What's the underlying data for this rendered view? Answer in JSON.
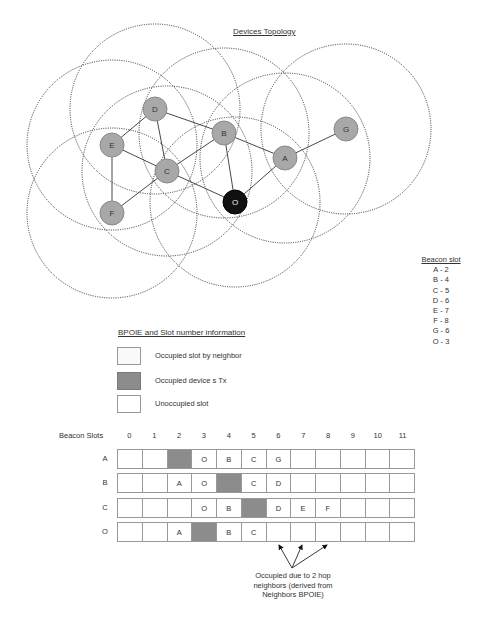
{
  "topology": {
    "title": "Devices Topology",
    "range_radius": 85,
    "nodes": [
      {
        "id": "D",
        "x": 155,
        "y": 109,
        "fill": "#a8a8a8"
      },
      {
        "id": "E",
        "x": 112,
        "y": 145,
        "fill": "#a8a8a8"
      },
      {
        "id": "B",
        "x": 224,
        "y": 133,
        "fill": "#a8a8a8"
      },
      {
        "id": "G",
        "x": 346,
        "y": 129,
        "fill": "#a8a8a8"
      },
      {
        "id": "A",
        "x": 285,
        "y": 158,
        "fill": "#a8a8a8"
      },
      {
        "id": "C",
        "x": 167,
        "y": 171,
        "fill": "#a8a8a8"
      },
      {
        "id": "F",
        "x": 112,
        "y": 213,
        "fill": "#a8a8a8"
      },
      {
        "id": "O",
        "x": 235,
        "y": 202,
        "fill": "#111111"
      }
    ],
    "links": [
      [
        "D",
        "E"
      ],
      [
        "D",
        "C"
      ],
      [
        "D",
        "B"
      ],
      [
        "E",
        "C"
      ],
      [
        "E",
        "F"
      ],
      [
        "F",
        "C"
      ],
      [
        "C",
        "B"
      ],
      [
        "C",
        "O"
      ],
      [
        "B",
        "O"
      ],
      [
        "B",
        "A"
      ],
      [
        "A",
        "O"
      ],
      [
        "A",
        "G"
      ]
    ]
  },
  "beacon_slot_legend": {
    "title": "Beacon slot",
    "items": [
      "A - 2",
      "B - 4",
      "C - 5",
      "D - 6",
      "E - 7",
      "F - 8",
      "G - 6",
      "O - 3"
    ]
  },
  "bpoie_legend": {
    "title": "BPOIE and Slot number information",
    "items": [
      {
        "label": "Occupied slot by neighbor",
        "style": "neighbor"
      },
      {
        "label": "Occupied device s Tx",
        "style": "tx"
      },
      {
        "label": "Unoccupied slot",
        "style": "empty"
      }
    ]
  },
  "slot_table": {
    "header_label": "Beacon Slots",
    "slots": [
      "0",
      "1",
      "2",
      "3",
      "4",
      "5",
      "6",
      "7",
      "8",
      "9",
      "10",
      "11"
    ],
    "tx_color": "#8c8c8c",
    "rows": [
      {
        "device": "A",
        "cells": [
          "",
          "",
          "#TX",
          "O",
          "B",
          "C",
          "G",
          "",
          "",
          "",
          "",
          ""
        ]
      },
      {
        "device": "B",
        "cells": [
          "",
          "",
          "A",
          "O",
          "#TX",
          "C",
          "D",
          "",
          "",
          "",
          "",
          ""
        ]
      },
      {
        "device": "C",
        "cells": [
          "",
          "",
          "",
          "O",
          "B",
          "#TX",
          "D",
          "E",
          "F",
          "",
          "",
          ""
        ]
      },
      {
        "device": "O",
        "cells": [
          "",
          "",
          "A",
          "#TX",
          "B",
          "C",
          "",
          "",
          "",
          "",
          "",
          ""
        ]
      }
    ]
  },
  "annotation": {
    "line1": "Occupied due to 2 hop",
    "line2": "neighbors  (derived from",
    "line3": "Neighbors BPOIE)"
  }
}
